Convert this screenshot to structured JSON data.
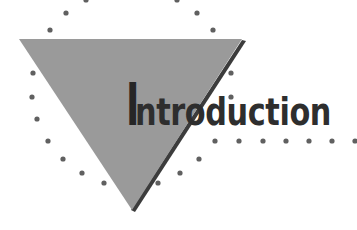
{
  "heading": {
    "first_letter": "I",
    "rest": "ntroduction",
    "full_text": "Introduction"
  },
  "colors": {
    "triangle_fill": "#9a9a9a",
    "triangle_shadow": "#3c3c3c",
    "dots": "#606060",
    "text": "#2e2e2e",
    "background": "#ffffff"
  },
  "decoration": {
    "shape": "inverted-triangle",
    "dot_pattern": "dotted-circle-with-horizontal-trail"
  }
}
